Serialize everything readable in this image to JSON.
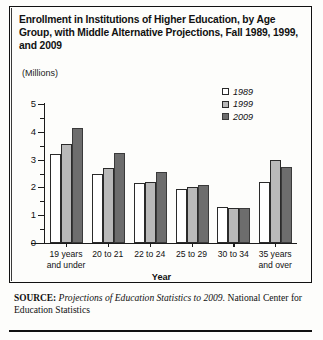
{
  "title": "Enrollment in Institutions of Higher Education, by Age Group, with Middle Alternative Projections, Fall 1989, 1999, and 2009",
  "units_label": "(Millions)",
  "axis_title": "Year",
  "source": {
    "label": "SOURCE:",
    "italic_part": "Projections of Education Statistics to 2009.",
    "rest": " National  Center for Education Statistics"
  },
  "legend": {
    "items": [
      {
        "label": "1989",
        "color": "#ffffff"
      },
      {
        "label": "1999",
        "color": "#b9b9b9"
      },
      {
        "label": "2009",
        "color": "#6d6d6d"
      }
    ]
  },
  "chart_data": {
    "type": "bar",
    "title": "Enrollment in Institutions of Higher Education, by Age Group, with Middle Alternative Projections, Fall 1989, 1999, and 2009",
    "xlabel": "Year",
    "ylabel": "(Millions)",
    "ylim": [
      0,
      5
    ],
    "yticks": [
      0,
      1,
      2,
      3,
      4,
      5
    ],
    "ytick_labels": [
      "0",
      "1",
      "2",
      "3",
      "4",
      "5"
    ],
    "minor_tick_interval": 0.5,
    "grid": false,
    "legend_position": "top-right",
    "categories": [
      "19 years and under",
      "20 to 21",
      "22 to 24",
      "25 to 29",
      "30 to 34",
      "35 years and over"
    ],
    "category_lines": [
      [
        "19 years",
        "and under"
      ],
      [
        "20 to 21"
      ],
      [
        "22 to 24"
      ],
      [
        "25 to 29"
      ],
      [
        "30 to 34"
      ],
      [
        "35 years",
        "and over"
      ]
    ],
    "series": [
      {
        "name": "1989",
        "color": "#ffffff",
        "values": [
          3.2,
          2.5,
          2.15,
          1.95,
          1.3,
          2.2
        ]
      },
      {
        "name": "1999",
        "color": "#b9b9b9",
        "values": [
          3.55,
          2.7,
          2.2,
          2.0,
          1.25,
          3.0
        ]
      },
      {
        "name": "2009",
        "color": "#6d6d6d",
        "values": [
          4.15,
          3.25,
          2.55,
          2.1,
          1.25,
          2.75
        ]
      }
    ]
  }
}
